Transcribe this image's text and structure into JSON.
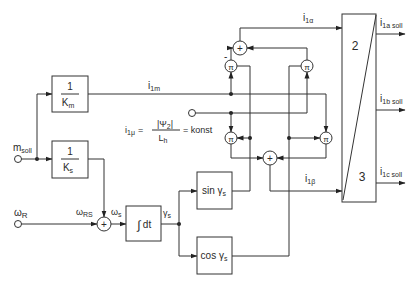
{
  "diagram": {
    "type": "block-diagram",
    "inputs": {
      "m_soll": {
        "label": "m",
        "sub": "soll"
      },
      "omega_R": {
        "label": "ω",
        "sub": "R"
      }
    },
    "blocks": {
      "km": {
        "num": "1",
        "den": "K",
        "den_sub": "m"
      },
      "ks": {
        "num": "1",
        "den": "K",
        "den_sub": "s"
      },
      "integrator": {
        "prefix": "∫",
        "label": "dt"
      },
      "sin": {
        "label": "sin γ",
        "sub": "s"
      },
      "cos": {
        "label": "cos γ",
        "sub": "s"
      },
      "transform": {
        "top_label": "2",
        "bottom_label": "3"
      }
    },
    "signals": {
      "i1m": {
        "label": "i",
        "sub": "1m"
      },
      "i1alpha": {
        "label": "i",
        "sub": "1α"
      },
      "i1beta": {
        "label": "i",
        "sub": "1β"
      },
      "omega_RS": {
        "label": "ω",
        "sub": "RS"
      },
      "omega_s": {
        "label": "ω",
        "sub": "s"
      },
      "gamma_s": {
        "label": "γ",
        "sub": "s"
      }
    },
    "formula": {
      "lhs": "i",
      "lhs_sub": "1μ",
      "eq": "=",
      "num": "|Ψ",
      "num_sub": "2",
      "num_end": "|",
      "den": "L",
      "den_sub": "h",
      "rhs": "= konst"
    },
    "outputs": {
      "i1a": {
        "label": "i",
        "sub": "1a soll"
      },
      "i1b": {
        "label": "i",
        "sub": "1b soll"
      },
      "i1c": {
        "label": "i",
        "sub": "1c soll"
      }
    },
    "operators": {
      "sum_symbol": "+",
      "mult_symbol": "π",
      "minus_sign": "-"
    }
  }
}
